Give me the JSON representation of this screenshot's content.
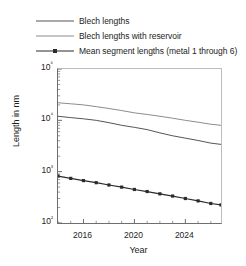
{
  "chart_data": {
    "type": "line",
    "title": "",
    "xlabel": "Year",
    "ylabel": "Length in nm",
    "xlim": [
      2014.0,
      2026.8
    ],
    "ylim": [
      100,
      100000
    ],
    "yscale": "log",
    "grid": false,
    "legend_position": "above-plot",
    "xticks": [
      2016,
      2020,
      2024
    ],
    "xtick_labels": [
      "2016",
      "2020",
      "2024"
    ],
    "yticks": [
      100,
      1000,
      10000,
      100000
    ],
    "ytick_labels": [
      "10²",
      "10³",
      "10⁴",
      "10⁵"
    ],
    "series": [
      {
        "name": "Blech lengths",
        "color": "#555555",
        "marker": "none",
        "x": [
          2014.0,
          2015.0,
          2016.0,
          2017.0,
          2018.0,
          2019.0,
          2020.0,
          2021.0,
          2022.0,
          2023.0,
          2024.0,
          2025.0,
          2026.0,
          2026.8
        ],
        "values": [
          12000,
          11300,
          10700,
          10000,
          9000,
          8000,
          7300,
          6600,
          5700,
          5000,
          4500,
          4050,
          3600,
          3400
        ]
      },
      {
        "name": "Blech lengths with reservoir",
        "color": "#8c8c8c",
        "marker": "none",
        "x": [
          2014.0,
          2015.0,
          2016.0,
          2017.0,
          2018.0,
          2019.0,
          2020.0,
          2021.0,
          2022.0,
          2023.0,
          2024.0,
          2025.0,
          2026.0,
          2026.8
        ],
        "values": [
          22000,
          21000,
          20000,
          18500,
          17000,
          15500,
          14000,
          13000,
          12000,
          11000,
          10000,
          9200,
          8400,
          8000
        ]
      },
      {
        "name": "Mean segment lengths (metal 1 through 6)",
        "color": "#2b2b2b",
        "marker": "square",
        "x": [
          2014.0,
          2015.0,
          2016.0,
          2017.0,
          2018.0,
          2019.0,
          2020.0,
          2021.0,
          2022.0,
          2023.0,
          2024.0,
          2025.0,
          2026.0,
          2026.8
        ],
        "values": [
          820,
          740,
          670,
          610,
          550,
          500,
          450,
          410,
          370,
          335,
          300,
          270,
          240,
          225
        ]
      }
    ]
  },
  "legend": {
    "items": [
      {
        "label": "Blech lengths",
        "color": "#555555",
        "marker": "none"
      },
      {
        "label": "Blech lengths with reservoir",
        "color": "#8c8c8c",
        "marker": "none"
      },
      {
        "label": "Mean segment lengths (metal 1 through 6)",
        "color": "#2b2b2b",
        "marker": "square"
      }
    ]
  },
  "axes": {
    "x_title": "Year",
    "y_title": "Length in nm"
  }
}
